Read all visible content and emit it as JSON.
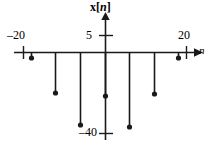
{
  "figure": {
    "title": "x[n]",
    "y_axis_label": "x[n]",
    "x_axis_label": "n",
    "axis_color": "#1a1a1a"
  },
  "labels": {
    "x_tick_neg20": "–20",
    "x_tick_pos20": "20",
    "y_tick_5": "5",
    "y_tick_neg40": "–40",
    "axis_n": "n",
    "axis_xn_x": "x",
    "axis_xn_bracket_open": "[",
    "axis_xn_n": "n",
    "axis_xn_bracket_close": "]"
  },
  "chart_data": {
    "type": "scatter",
    "title": "x[n]",
    "xlabel": "n",
    "ylabel": "x[n]",
    "xlim": [
      -28,
      28
    ],
    "ylim": [
      -44,
      6
    ],
    "grid": false,
    "legend": null,
    "style": "discrete-time stem plot, all samples negative",
    "x_ticks": [
      -20,
      20
    ],
    "x_tick_labels": [
      "–20",
      "20"
    ],
    "y_ticks": [
      5,
      -40
    ],
    "y_tick_labels": [
      "5",
      "–40"
    ],
    "x": [
      -24,
      -20,
      -15,
      -10,
      -5,
      0,
      5,
      10,
      15,
      20,
      24
    ],
    "values": [
      0,
      -4,
      -20,
      -36,
      -22,
      -38,
      -21,
      -4,
      0,
      0,
      0
    ],
    "stems": [
      {
        "n": -20,
        "value": -4,
        "px": 31,
        "py": 58
      },
      {
        "n": -15,
        "value": -20,
        "px": 55,
        "py": 93
      },
      {
        "n": -10,
        "value": -36,
        "px": 80,
        "py": 125
      },
      {
        "n": -5,
        "value": -22,
        "px": 105,
        "py": 96
      },
      {
        "n": 0,
        "value": -37,
        "px": 129,
        "py": 127
      },
      {
        "n": 5,
        "value": -21,
        "px": 154,
        "py": 94
      },
      {
        "n": 10,
        "value": -4,
        "px": 178,
        "py": 58
      }
    ]
  },
  "geometry": {
    "baseline_y": 52,
    "vaxis_x": 105,
    "tick_neg20_x": 23,
    "tick_pos20_x": 186,
    "tick_5_y": 35,
    "tick_neg40_y": 133
  }
}
